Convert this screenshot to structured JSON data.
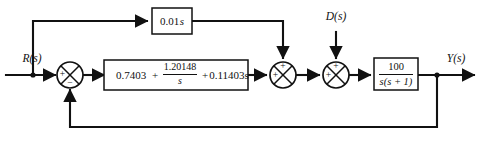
{
  "diagram": {
    "background_color": "#ffffff",
    "line_color": "#111111",
    "signals": {
      "input_label": "R(s)",
      "disturbance_label": "D(s)",
      "output_label": "Y(s)"
    },
    "blocks": {
      "feedforward": {
        "name": "derivative-feedforward-block",
        "expression": "0.01s",
        "coefficient": "0.01",
        "variable": "s"
      },
      "controller": {
        "name": "pid-controller-block",
        "proportional_gain": "0.7403",
        "integral_numerator": "1.20148",
        "integral_denominator": "s",
        "derivative_term": "0.11403s",
        "plus_sign_1": "+",
        "plus_sign_2": "+",
        "full_expression": "0.7403 + 1.20148/s + 0.11403s"
      },
      "plant": {
        "name": "plant-transfer-function-block",
        "numerator": "100",
        "denominator": "s(s + 1)",
        "full_expression": "100 / (s(s + 1))"
      }
    },
    "summers": [
      {
        "name": "error-summing-junction",
        "left_sign": "+",
        "bottom_sign": "−"
      },
      {
        "name": "feedforward-summing-junction",
        "left_sign": "+",
        "top_sign": "+"
      },
      {
        "name": "disturbance-summing-junction",
        "left_sign": "+",
        "top_sign": "+"
      }
    ]
  }
}
